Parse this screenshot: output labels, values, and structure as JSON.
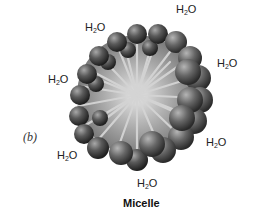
{
  "figure": {
    "panel_label": "(b)",
    "caption": "Micelle",
    "water_labels": [
      {
        "text_main": "H",
        "text_sub": "2",
        "text_tail": "O",
        "x": 176,
        "y": 8
      },
      {
        "text_main": "H",
        "text_sub": "2",
        "text_tail": "O",
        "x": 85,
        "y": 26
      },
      {
        "text_main": "H",
        "text_sub": "2",
        "text_tail": "O",
        "x": 217,
        "y": 61
      },
      {
        "text_main": "H",
        "text_sub": "2",
        "text_tail": "O",
        "x": 48,
        "y": 76
      },
      {
        "text_main": "H",
        "text_sub": "2",
        "text_tail": "O",
        "x": 206,
        "y": 139
      },
      {
        "text_main": "H",
        "text_sub": "2",
        "text_tail": "O",
        "x": 57,
        "y": 150
      },
      {
        "text_main": "H",
        "text_sub": "2",
        "text_tail": "O",
        "x": 137,
        "y": 178
      }
    ],
    "colors": {
      "head_dark": "#2e2e2e",
      "head_light": "#9a9a9a",
      "tail": "#c8c8c8",
      "background": "#ffffff"
    }
  }
}
